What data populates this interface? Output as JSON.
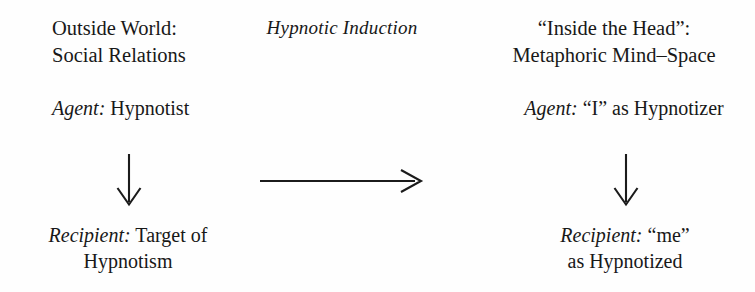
{
  "diagram": {
    "type": "conceptual-mapping-diagram",
    "background_color": "#fefefe",
    "text_color": "#181818",
    "columns": [
      {
        "id": "source",
        "heading_lines": [
          "Outside World:",
          "Social Relations"
        ],
        "agent_role_label": "Agent:",
        "agent_value": "Hypnotist",
        "recipient_role_label": "Recipient:",
        "recipient_value_lines": [
          "Target of",
          "Hypnotism"
        ]
      },
      {
        "id": "target",
        "heading_lines": [
          "“Inside the Head”:",
          "Metaphoric Mind–Space"
        ],
        "agent_role_label": "Agent:",
        "agent_value": "“I” as Hypnotizer",
        "recipient_role_label": "Recipient:",
        "recipient_value_lines": [
          "“me”",
          "as Hypnotized"
        ]
      }
    ],
    "mapping_label": "Hypnotic Induction",
    "arrows": {
      "left_vertical": "arrow-down-icon",
      "right_vertical": "arrow-down-icon",
      "horizontal_mapping": "arrow-right-icon"
    }
  },
  "left": {
    "heading_line1": "Outside World:",
    "heading_line2": "Social Relations",
    "agent_label": "Agent:",
    "agent_text": " Hypnotist",
    "recipient_label": "Recipient:",
    "recipient_text": " Target of",
    "recipient_line2": "Hypnotism"
  },
  "right": {
    "heading_line1": "“Inside the Head”:",
    "heading_line2": "Metaphoric Mind–Space",
    "agent_label": "Agent:",
    "agent_text": " “I” as Hypnotizer",
    "recipient_label": "Recipient:",
    "recipient_text": " “me”",
    "recipient_line2": "as Hypnotized"
  },
  "center": {
    "induction_label": "Hypnotic Induction"
  }
}
